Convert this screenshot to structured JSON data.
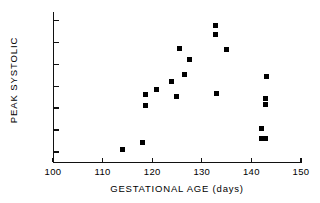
{
  "chart_data": {
    "type": "scatter",
    "title": "",
    "xlabel": "GESTATIONAL AGE (days)",
    "ylabel": "PEAK SYSTOLIC",
    "xlim": [
      100,
      150
    ],
    "ylim": [
      65,
      132
    ],
    "xticks": [
      100,
      110,
      120,
      130,
      140,
      150
    ],
    "yticks": [
      70,
      80,
      90,
      100,
      110,
      120,
      130
    ],
    "grid": false,
    "legend": null,
    "marker": "filled-square",
    "marker_color": "#000000",
    "points": [
      {
        "x": 114.0,
        "y": 71.2
      },
      {
        "x": 118.0,
        "y": 74.3
      },
      {
        "x": 118.6,
        "y": 91.3
      },
      {
        "x": 118.7,
        "y": 96.4
      },
      {
        "x": 120.9,
        "y": 98.5
      },
      {
        "x": 123.9,
        "y": 102.2
      },
      {
        "x": 124.9,
        "y": 95.4
      },
      {
        "x": 125.6,
        "y": 117.2
      },
      {
        "x": 126.5,
        "y": 105.3
      },
      {
        "x": 127.6,
        "y": 112.4
      },
      {
        "x": 132.7,
        "y": 127.6
      },
      {
        "x": 132.8,
        "y": 123.4
      },
      {
        "x": 132.9,
        "y": 96.5
      },
      {
        "x": 134.9,
        "y": 116.6
      },
      {
        "x": 142.0,
        "y": 76.3
      },
      {
        "x": 142.0,
        "y": 80.5
      },
      {
        "x": 142.9,
        "y": 76.3
      },
      {
        "x": 142.9,
        "y": 91.5
      },
      {
        "x": 142.9,
        "y": 94.6
      },
      {
        "x": 143.0,
        "y": 104.5
      }
    ]
  }
}
